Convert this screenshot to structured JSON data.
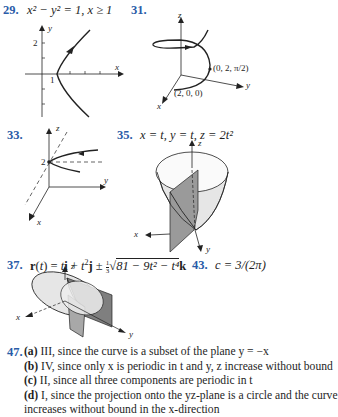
{
  "problems": {
    "p29": {
      "number": "29.",
      "equation": "x² − y² = 1, x ≥ 1",
      "figure": {
        "axis_labels": {
          "x": "x",
          "y": "y"
        },
        "tick_labels": {
          "y_tick": "2",
          "x_tick": "1"
        },
        "description": "right branch of hyperbola with arrow pointing upward"
      }
    },
    "p31": {
      "number": "31.",
      "figure": {
        "axis_labels": {
          "x": "x",
          "y": "y",
          "z": "z"
        },
        "point_labels": [
          "(0, 2, π/2)",
          "(2, 0, 0)"
        ],
        "description": "helix rising around z-axis"
      }
    },
    "p33": {
      "number": "33.",
      "figure": {
        "axis_labels": {
          "x": "x",
          "y": "y",
          "z": "z"
        },
        "tick_labels": {
          "z_tick": "2"
        },
        "description": "curve approaching point on z-axis at height 2"
      }
    },
    "p35": {
      "number": "35.",
      "equation": "x = t, y = t, z = 2t²",
      "figure": {
        "axis_labels": {
          "x": "x",
          "y": "y",
          "z": "z"
        },
        "description": "paraboloid intersected by vertical plane"
      }
    },
    "p37": {
      "number": "37.",
      "equation_parts": {
        "lead": "r(t) = t",
        "i": "i",
        "plus": " + t",
        "sq": "2",
        "j": "j",
        "pm": " ± ",
        "frac_num": "1",
        "frac_den": "3",
        "rad": "81 − 9t² − t⁴",
        "k": "k"
      },
      "figure": {
        "axis_labels": {
          "x": "x",
          "y": "y",
          "z": "z"
        },
        "description": "ellipsoid intersected by parabolic cylinder"
      }
    },
    "p43": {
      "number": "43.",
      "equation": "c = 3/(2π)"
    },
    "p47": {
      "number": "47.",
      "answers": [
        {
          "label": "(a)",
          "text": "III, since the curve is a subset of the plane y = −x"
        },
        {
          "label": "(b)",
          "text": "IV, since only x is periodic in t and y, z increase without bound"
        },
        {
          "label": "(c)",
          "text": "II, since all three components are periodic in t"
        },
        {
          "label": "(d)",
          "text": "I, since the projection onto the yz-plane is a circle and the curve",
          "continuation": "increases without bound in the x-direction"
        }
      ]
    }
  },
  "colors": {
    "problem_number": "#2a5ca8",
    "text": "#1e1e1e",
    "surface_light": "#e4e4e4",
    "surface_dark": "#8f8f8f"
  }
}
